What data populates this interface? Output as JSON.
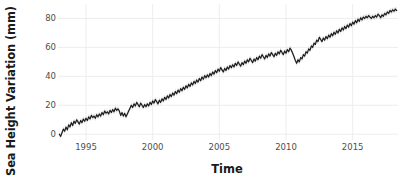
{
  "chart_data": {
    "type": "line",
    "title": "",
    "xlabel": "Time",
    "ylabel": "Sea Height Variation (mm)",
    "xlim": [
      1992.9,
      2018.4
    ],
    "ylim": [
      -4,
      90
    ],
    "grid": true,
    "legend": null,
    "xticks": [
      1995,
      2000,
      2005,
      2010,
      2015
    ],
    "xtick_labels": [
      "1995",
      "2000",
      "2005",
      "2010",
      "2015"
    ],
    "yticks": [
      0,
      20,
      40,
      60,
      80
    ],
    "ytick_labels": [
      "0",
      "20",
      "40",
      "60",
      "80"
    ],
    "line_color": "#1a1a1a",
    "band_color": "#c9c9c9",
    "panel_bg": "#ffffff",
    "grid_color": "#ebebeb",
    "series": [
      {
        "name": "Sea Height Variation",
        "x": [
          1993.0,
          1993.1,
          1993.2,
          1993.3,
          1993.4,
          1993.5,
          1993.6,
          1993.7,
          1993.8,
          1993.9,
          1994.0,
          1994.1,
          1994.2,
          1994.3,
          1994.4,
          1994.5,
          1994.6,
          1994.7,
          1994.8,
          1994.9,
          1995.0,
          1995.1,
          1995.2,
          1995.3,
          1995.4,
          1995.5,
          1995.6,
          1995.7,
          1995.8,
          1995.9,
          1996.0,
          1996.1,
          1996.2,
          1996.3,
          1996.4,
          1996.5,
          1996.6,
          1996.7,
          1996.8,
          1996.9,
          1997.0,
          1997.1,
          1997.2,
          1997.3,
          1997.4,
          1997.5,
          1997.6,
          1997.7,
          1997.8,
          1997.9,
          1998.0,
          1998.1,
          1998.2,
          1998.3,
          1998.4,
          1998.5,
          1998.6,
          1998.7,
          1998.8,
          1998.9,
          1999.0,
          1999.1,
          1999.2,
          1999.3,
          1999.4,
          1999.5,
          1999.6,
          1999.7,
          1999.8,
          1999.9,
          2000.0,
          2000.1,
          2000.2,
          2000.3,
          2000.4,
          2000.5,
          2000.6,
          2000.7,
          2000.8,
          2000.9,
          2001.0,
          2001.1,
          2001.2,
          2001.3,
          2001.4,
          2001.5,
          2001.6,
          2001.7,
          2001.8,
          2001.9,
          2002.0,
          2002.1,
          2002.2,
          2002.3,
          2002.4,
          2002.5,
          2002.6,
          2002.7,
          2002.8,
          2002.9,
          2003.0,
          2003.1,
          2003.2,
          2003.3,
          2003.4,
          2003.5,
          2003.6,
          2003.7,
          2003.8,
          2003.9,
          2004.0,
          2004.1,
          2004.2,
          2004.3,
          2004.4,
          2004.5,
          2004.6,
          2004.7,
          2004.8,
          2004.9,
          2005.0,
          2005.1,
          2005.2,
          2005.3,
          2005.4,
          2005.5,
          2005.6,
          2005.7,
          2005.8,
          2005.9,
          2006.0,
          2006.1,
          2006.2,
          2006.3,
          2006.4,
          2006.5,
          2006.6,
          2006.7,
          2006.8,
          2006.9,
          2007.0,
          2007.1,
          2007.2,
          2007.3,
          2007.4,
          2007.5,
          2007.6,
          2007.7,
          2007.8,
          2007.9,
          2008.0,
          2008.1,
          2008.2,
          2008.3,
          2008.4,
          2008.5,
          2008.6,
          2008.7,
          2008.8,
          2008.9,
          2009.0,
          2009.1,
          2009.2,
          2009.3,
          2009.4,
          2009.5,
          2009.6,
          2009.7,
          2009.8,
          2009.9,
          2010.0,
          2010.1,
          2010.2,
          2010.3,
          2010.4,
          2010.5,
          2010.6,
          2010.7,
          2010.8,
          2010.9,
          2011.0,
          2011.1,
          2011.2,
          2011.3,
          2011.4,
          2011.5,
          2011.6,
          2011.7,
          2011.8,
          2011.9,
          2012.0,
          2012.1,
          2012.2,
          2012.3,
          2012.4,
          2012.5,
          2012.6,
          2012.7,
          2012.8,
          2012.9,
          2013.0,
          2013.1,
          2013.2,
          2013.3,
          2013.4,
          2013.5,
          2013.6,
          2013.7,
          2013.8,
          2013.9,
          2014.0,
          2014.1,
          2014.2,
          2014.3,
          2014.4,
          2014.5,
          2014.6,
          2014.7,
          2014.8,
          2014.9,
          2015.0,
          2015.1,
          2015.2,
          2015.3,
          2015.4,
          2015.5,
          2015.6,
          2015.7,
          2015.8,
          2015.9,
          2016.0,
          2016.1,
          2016.2,
          2016.3,
          2016.4,
          2016.5,
          2016.6,
          2016.7,
          2016.8,
          2016.9,
          2017.0,
          2017.1,
          2017.2,
          2017.3,
          2017.4,
          2017.5,
          2017.6,
          2017.7,
          2017.8,
          2017.9,
          2018.0,
          2018.1,
          2018.2,
          2018.3
        ],
        "y": [
          0.0,
          -1.5,
          1.0,
          3.5,
          2.0,
          5.0,
          3.0,
          6.5,
          5.0,
          8.0,
          6.0,
          9.0,
          7.5,
          10.0,
          8.5,
          7.0,
          9.5,
          8.0,
          10.5,
          9.0,
          11.0,
          9.5,
          12.0,
          10.5,
          13.0,
          11.5,
          12.5,
          11.0,
          13.5,
          12.0,
          14.0,
          12.5,
          15.0,
          13.5,
          16.0,
          14.5,
          15.5,
          14.0,
          16.5,
          15.0,
          17.0,
          15.5,
          18.0,
          16.5,
          17.5,
          16.0,
          13.0,
          15.0,
          12.5,
          14.5,
          12.0,
          14.0,
          16.0,
          18.0,
          20.0,
          18.5,
          21.0,
          19.5,
          22.0,
          20.5,
          19.0,
          21.5,
          20.0,
          18.5,
          20.5,
          19.0,
          21.0,
          19.5,
          22.0,
          20.5,
          23.0,
          21.5,
          24.0,
          22.5,
          21.0,
          23.5,
          22.0,
          24.5,
          23.0,
          25.5,
          24.0,
          26.5,
          25.0,
          27.5,
          26.0,
          28.5,
          27.0,
          29.5,
          28.0,
          30.5,
          29.0,
          31.5,
          30.0,
          32.5,
          31.0,
          33.5,
          32.0,
          34.5,
          33.0,
          35.5,
          34.0,
          36.5,
          35.0,
          37.5,
          36.0,
          38.5,
          37.0,
          39.5,
          38.0,
          40.5,
          39.0,
          41.0,
          39.5,
          42.0,
          40.5,
          43.0,
          41.5,
          44.0,
          42.5,
          45.0,
          43.5,
          46.0,
          44.5,
          43.0,
          45.5,
          44.0,
          46.5,
          45.0,
          47.5,
          46.0,
          48.0,
          46.5,
          49.0,
          47.5,
          50.0,
          48.5,
          47.0,
          49.5,
          48.0,
          50.5,
          49.0,
          51.5,
          50.0,
          52.5,
          51.0,
          49.5,
          52.0,
          50.5,
          53.0,
          51.5,
          54.0,
          52.5,
          55.0,
          53.5,
          52.0,
          54.5,
          53.0,
          55.5,
          54.0,
          56.5,
          55.0,
          53.5,
          56.0,
          54.5,
          57.0,
          55.5,
          58.0,
          56.5,
          55.0,
          57.5,
          56.0,
          58.5,
          57.0,
          59.5,
          58.0,
          56.0,
          53.5,
          51.0,
          49.0,
          51.5,
          50.0,
          53.0,
          52.0,
          55.0,
          54.0,
          57.0,
          56.0,
          59.0,
          58.0,
          61.0,
          60.0,
          63.0,
          62.0,
          65.0,
          64.0,
          67.0,
          65.5,
          64.0,
          66.5,
          65.0,
          67.5,
          66.0,
          68.5,
          67.0,
          69.5,
          68.0,
          70.5,
          69.0,
          71.5,
          70.0,
          72.5,
          71.0,
          73.5,
          72.0,
          74.5,
          73.0,
          75.5,
          74.0,
          76.5,
          75.0,
          77.5,
          76.0,
          78.5,
          77.0,
          79.5,
          78.0,
          80.5,
          79.0,
          81.0,
          80.0,
          81.5,
          80.5,
          82.0,
          81.0,
          80.0,
          81.5,
          80.5,
          82.0,
          81.0,
          83.0,
          82.0,
          80.5,
          82.5,
          81.5,
          83.5,
          82.5,
          84.5,
          83.5,
          85.5,
          84.5,
          86.0,
          85.0,
          86.5,
          85.5
        ]
      }
    ]
  }
}
